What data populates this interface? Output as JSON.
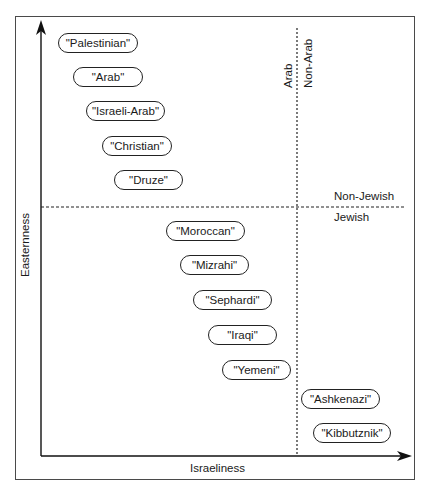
{
  "diagram": {
    "type": "quadrant-map",
    "axes": {
      "x_label": "Israeliness",
      "y_label": "Easternness"
    },
    "dividers": {
      "vertical": {
        "left_label": "Arab",
        "right_label": "Non-Arab"
      },
      "horizontal": {
        "top_label": "Non-Jewish",
        "bottom_label": "Jewish"
      }
    },
    "items": [
      {
        "label": "\"Palestinian\"",
        "quadrant": "Arab / Non-Jewish"
      },
      {
        "label": "\"Arab\"",
        "quadrant": "Arab / Non-Jewish"
      },
      {
        "label": "\"Israeli-Arab\"",
        "quadrant": "Arab / Non-Jewish"
      },
      {
        "label": "\"Christian\"",
        "quadrant": "Arab / Non-Jewish"
      },
      {
        "label": "\"Druze\"",
        "quadrant": "Arab / Non-Jewish"
      },
      {
        "label": "\"Moroccan\"",
        "quadrant": "Arab / Jewish"
      },
      {
        "label": "\"Mizrahi\"",
        "quadrant": "Arab / Jewish"
      },
      {
        "label": "\"Sephardi\"",
        "quadrant": "Arab / Jewish"
      },
      {
        "label": "\"Iraqi\"",
        "quadrant": "Arab / Jewish"
      },
      {
        "label": "\"Yemeni\"",
        "quadrant": "Arab / Jewish"
      },
      {
        "label": "\"Ashkenazi\"",
        "quadrant": "Non-Arab / Jewish"
      },
      {
        "label": "\"Kibbutznik\"",
        "quadrant": "Non-Arab / Jewish"
      }
    ],
    "colors": {
      "ink": "#1a1a1a",
      "background": "#ffffff"
    }
  }
}
